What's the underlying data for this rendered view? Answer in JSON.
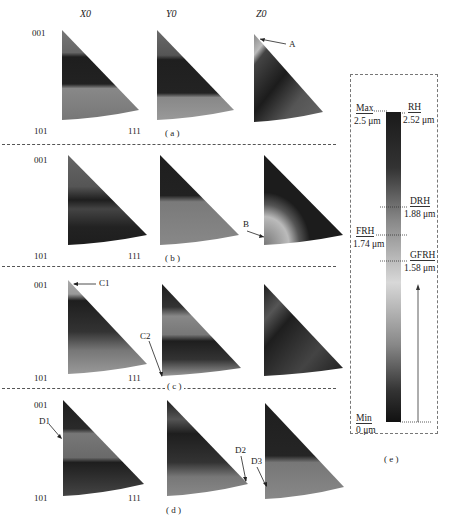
{
  "figure": {
    "column_headers": [
      "X0",
      "Y0",
      "Z0"
    ],
    "corner_labels": {
      "top": "001",
      "bottom_left": "101",
      "bottom_right": "111"
    },
    "rows": [
      {
        "caption": "( a )",
        "annotations": [
          {
            "label": "A",
            "panel": "Z0"
          }
        ]
      },
      {
        "caption": "( b )",
        "annotations": [
          {
            "label": "B",
            "panel": "Z0"
          }
        ]
      },
      {
        "caption": "( c )",
        "annotations": [
          {
            "label": "C1",
            "panel": "X0"
          },
          {
            "label": "C2",
            "panel": "Y0"
          }
        ]
      },
      {
        "caption": "( d )",
        "annotations": [
          {
            "label": "D1",
            "panel": "X0"
          },
          {
            "label": "D2",
            "panel": "Y0"
          },
          {
            "label": "D3",
            "panel": "Z0"
          }
        ]
      }
    ],
    "legend": {
      "caption": "( e )",
      "max_label": "Max",
      "max_value": "2.5 μm",
      "min_label": "Min",
      "min_value": "0 μm",
      "markers": [
        {
          "name": "RH",
          "value": "2.52 μm",
          "side": "right"
        },
        {
          "name": "DRH",
          "value": "1.88 μm",
          "side": "right"
        },
        {
          "name": "FRH",
          "value": "1.74 μm",
          "side": "left"
        },
        {
          "name": "GFRH",
          "value": "1.58 μm",
          "side": "right"
        }
      ]
    },
    "colors": {
      "dark": "#1c1c1c",
      "mid": "#6e6e6e",
      "light": "#b8b8b8",
      "dash": "#555555"
    }
  }
}
